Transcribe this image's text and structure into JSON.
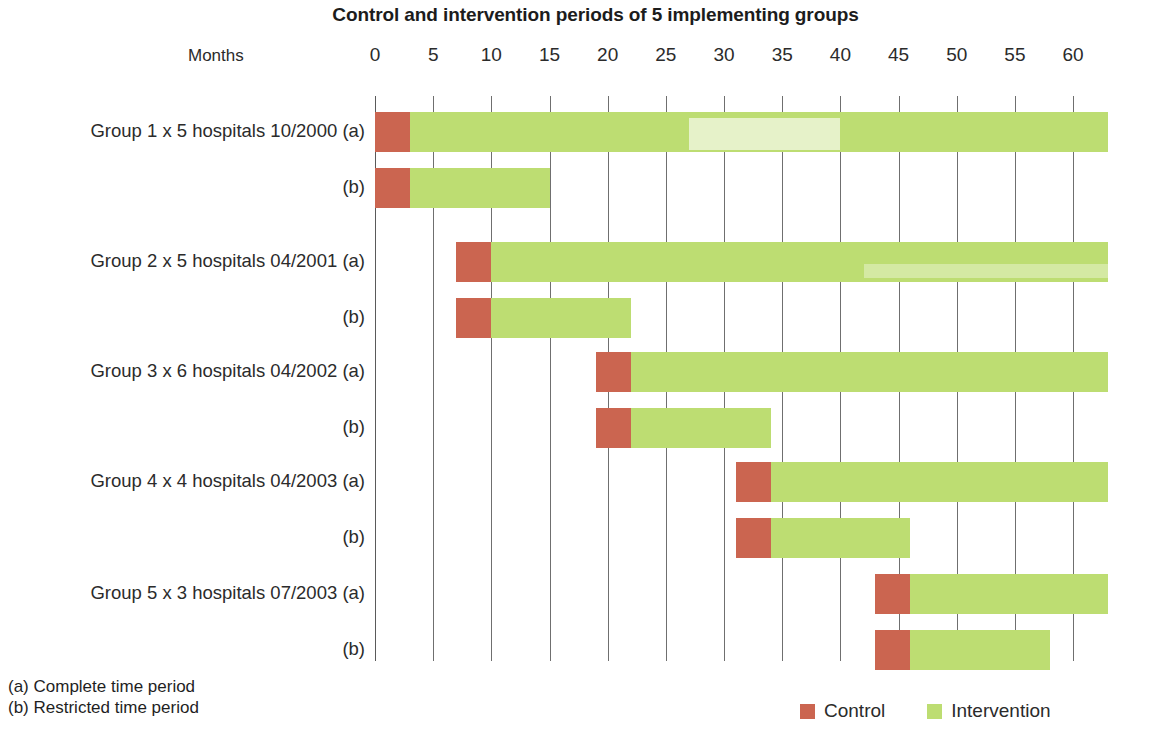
{
  "chart_data": {
    "type": "bar",
    "subtype": "gantt-horizontal-stacked",
    "title": "Control and intervention periods of 5 implementing groups",
    "xlabel": "Months",
    "ylabel": "",
    "xlim": [
      0,
      63
    ],
    "xticks": [
      0,
      5,
      10,
      15,
      20,
      25,
      30,
      35,
      40,
      45,
      50,
      55,
      60
    ],
    "xtick_labels": [
      "0",
      "5",
      "10",
      "15",
      "20",
      "25",
      "30",
      "35",
      "40",
      "45",
      "50",
      "55",
      "60"
    ],
    "grid": "vertical",
    "legend_position": "bottom-right",
    "series": [
      {
        "name": "Control",
        "color": "#cb6550"
      },
      {
        "name": "Intervention",
        "color": "#bddd72"
      }
    ],
    "categories": [
      "Group 1 x 5 hospitals 10/2000 (a)",
      "(b)",
      "Group 2 x 5 hospitals 04/2001 (a)",
      "(b)",
      "Group 3 x 6 hospitals 04/2002 (a)",
      "(b)",
      "Group 4 x 4 hospitals 04/2003 (a)",
      "(b)",
      "Group 5 x 3 hospitals 07/2003 (a)",
      "(b)"
    ],
    "rows": [
      {
        "label": "Group 1 x 5 hospitals 10/2000 (a)",
        "control_start": 0,
        "control_end": 3,
        "intervention_start": 3,
        "intervention_end": 63
      },
      {
        "label": "(b)",
        "control_start": 0,
        "control_end": 3,
        "intervention_start": 3,
        "intervention_end": 15
      },
      {
        "label": "Group 2 x 5 hospitals 04/2001 (a)",
        "control_start": 7,
        "control_end": 10,
        "intervention_start": 10,
        "intervention_end": 63
      },
      {
        "label": "(b)",
        "control_start": 7,
        "control_end": 10,
        "intervention_start": 10,
        "intervention_end": 22
      },
      {
        "label": "Group 3 x 6 hospitals 04/2002 (a)",
        "control_start": 19,
        "control_end": 22,
        "intervention_start": 22,
        "intervention_end": 63
      },
      {
        "label": "(b)",
        "control_start": 19,
        "control_end": 22,
        "intervention_start": 22,
        "intervention_end": 34
      },
      {
        "label": "Group 4 x 4 hospitals 04/2003 (a)",
        "control_start": 31,
        "control_end": 34,
        "intervention_start": 34,
        "intervention_end": 63
      },
      {
        "label": "(b)",
        "control_start": 31,
        "control_end": 34,
        "intervention_start": 34,
        "intervention_end": 46
      },
      {
        "label": "Group 5 x 3 hospitals 07/2003 (a)",
        "control_start": 43,
        "control_end": 46,
        "intervention_start": 46,
        "intervention_end": 63
      },
      {
        "label": "(b)",
        "control_start": 43,
        "control_end": 46,
        "intervention_start": 46,
        "intervention_end": 58
      }
    ]
  },
  "chart": {
    "title": "Control and intervention periods of 5 implementing groups",
    "axis_caption": "Months"
  },
  "footnotes": {
    "a": "(a) Complete time period",
    "b": "(b) Restricted time period"
  },
  "legend": {
    "items": [
      {
        "label": "Control",
        "color": "#cb6550"
      },
      {
        "label": "Intervention",
        "color": "#bddd72"
      }
    ]
  }
}
